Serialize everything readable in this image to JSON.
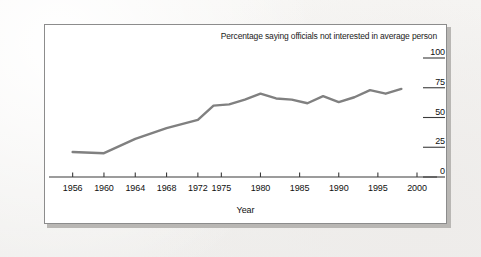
{
  "figure": {
    "background_color": "#f6f5f3",
    "panel_background": "#ffffff",
    "panel_border_color": "#8c8c8c",
    "line_color": "#808080",
    "text_color": "#101010"
  },
  "chart_data": {
    "type": "line",
    "title": "Percentage saying officials not interested in average person",
    "xlabel": "Year",
    "ylabel": "",
    "xlim": [
      1954,
      2000
    ],
    "ylim": [
      0,
      100
    ],
    "grid": false,
    "legend": "none",
    "ytick_labels": [
      "100",
      "75",
      "50",
      "25",
      "0"
    ],
    "ytick_values": [
      100,
      75,
      50,
      25,
      0
    ],
    "xtick_labels": [
      "1956",
      "1960",
      "1964",
      "1968",
      "1972",
      "1975",
      "1980",
      "1985",
      "1990",
      "1995",
      "2000"
    ],
    "xtick_values": [
      1956,
      1960,
      1964,
      1968,
      1972,
      1975,
      1980,
      1985,
      1990,
      1995,
      2000
    ],
    "series": [
      {
        "name": "Percentage saying officials not interested in average person",
        "color": "#808080",
        "x": [
          1956,
          1960,
          1964,
          1968,
          1972,
          1974,
          1976,
          1978,
          1980,
          1982,
          1984,
          1986,
          1988,
          1990,
          1992,
          1994,
          1996,
          1998
        ],
        "values": [
          21,
          20,
          32,
          41,
          48,
          60,
          61,
          65,
          70,
          66,
          65,
          62,
          68,
          63,
          67,
          73,
          70,
          74
        ]
      }
    ]
  }
}
